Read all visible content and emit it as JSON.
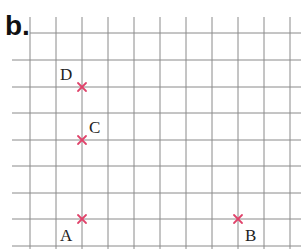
{
  "heading": "b.",
  "grid": {
    "vertical_lines_x": [
      30,
      56,
      82,
      108,
      134,
      160,
      186,
      212,
      238,
      264,
      290
    ],
    "horizontal_lines_y": [
      33,
      60,
      87,
      113,
      140,
      166,
      193,
      219,
      246
    ],
    "top_line_start_x": 30,
    "other_lines_start_x": 12,
    "line_color": "#8a8a8a"
  },
  "marker_color": "#e0426a",
  "points": [
    {
      "label": "D",
      "x": 82,
      "y": 87,
      "label_x": 60,
      "label_y": 66
    },
    {
      "label": "C",
      "x": 82,
      "y": 140,
      "label_x": 89,
      "label_y": 119
    },
    {
      "label": "A",
      "x": 82,
      "y": 219,
      "label_x": 60,
      "label_y": 227
    },
    {
      "label": "B",
      "x": 238,
      "y": 219,
      "label_x": 245,
      "label_y": 227
    }
  ]
}
